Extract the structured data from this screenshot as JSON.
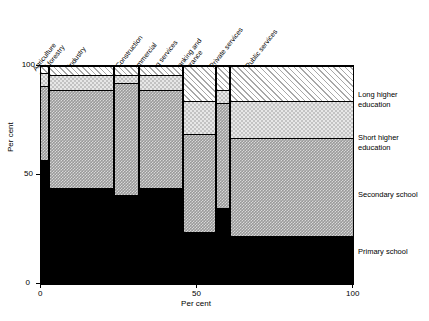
{
  "axes": {
    "y_label": "Per cent",
    "x_label": "Per cent",
    "y_ticks": [
      "0",
      "50",
      "100"
    ],
    "x_ticks": [
      "0",
      "50",
      "100"
    ]
  },
  "legend": [
    {
      "key": "long",
      "label_line1": "Long higher",
      "label_line2": "education"
    },
    {
      "key": "short",
      "label_line1": "Short higher",
      "label_line2": "education"
    },
    {
      "key": "secondary",
      "label_line1": "Secondary school",
      "label_line2": ""
    },
    {
      "key": "primary",
      "label_line1": "Primary school",
      "label_line2": ""
    }
  ],
  "columns": [
    {
      "name": "Agriculture and forestry",
      "header_lines": [
        "Agriculture",
        "and forestry"
      ]
    },
    {
      "name": "Industry",
      "header_lines": [
        "Industry"
      ]
    },
    {
      "name": "Construction",
      "header_lines": [
        "Construction"
      ]
    },
    {
      "name": "Commercial and retailing services",
      "header_lines": [
        "Commercial",
        "and",
        "retailing services"
      ]
    },
    {
      "name": "Banking and insurance",
      "header_lines": [
        "Banking and",
        "insurance"
      ]
    },
    {
      "name": "Private services",
      "header_lines": [
        "Private services"
      ]
    },
    {
      "name": "Public services",
      "header_lines": [
        "Public services"
      ]
    }
  ],
  "chart_data": {
    "type": "bar",
    "subtype": "mosaic-marimekko-stacked",
    "title": "",
    "xlabel": "Per cent",
    "ylabel": "Per cent",
    "xlim": [
      0,
      100
    ],
    "ylim": [
      0,
      100
    ],
    "grid": false,
    "legend_position": "right",
    "categories": [
      "Agriculture and forestry",
      "Industry",
      "Construction",
      "Commercial and retailing services",
      "Banking and insurance",
      "Private services",
      "Public services"
    ],
    "category_widths_percent": [
      2.5,
      21.0,
      8.0,
      14.0,
      10.5,
      4.5,
      39.5
    ],
    "category_x_ranges": [
      [
        0.0,
        2.5
      ],
      [
        2.5,
        23.5
      ],
      [
        23.5,
        31.5
      ],
      [
        31.5,
        45.5
      ],
      [
        45.5,
        56.0
      ],
      [
        56.0,
        60.5
      ],
      [
        60.5,
        100.0
      ]
    ],
    "series": [
      {
        "name": "Primary school",
        "values": [
          57,
          44,
          41,
          44,
          24,
          35,
          22
        ]
      },
      {
        "name": "Secondary school",
        "values": [
          34,
          45,
          51,
          45,
          45,
          48,
          45
        ]
      },
      {
        "name": "Short higher education",
        "values": [
          6,
          7,
          4,
          7,
          15,
          6,
          17
        ]
      },
      {
        "name": "Long higher education",
        "values": [
          3,
          4,
          4,
          4,
          16,
          11,
          16
        ]
      }
    ],
    "cumulative_tops": {
      "primary": [
        57,
        44,
        41,
        44,
        24,
        35,
        22
      ],
      "secondary": [
        91,
        89,
        92,
        89,
        69,
        83,
        67
      ],
      "short": [
        97,
        96,
        96,
        96,
        84,
        89,
        84
      ],
      "long": [
        100,
        100,
        100,
        100,
        100,
        100,
        100
      ]
    }
  }
}
